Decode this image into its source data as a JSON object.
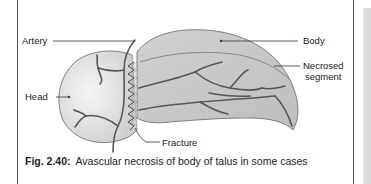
{
  "figure": {
    "number": "Fig. 2.40:",
    "caption": "Avascular necrosis of body of talus in some cases"
  },
  "labels": {
    "artery": "Artery",
    "head": "Head",
    "body": "Body",
    "necrosed_line1": "Necrosed",
    "necrosed_line2": "segment",
    "fracture": "Fracture"
  },
  "colors": {
    "head_fill": "#e4e4e4",
    "body_fill": "#c8c8c8",
    "vessel": "#555555",
    "outline": "#666666",
    "text": "#222222"
  }
}
